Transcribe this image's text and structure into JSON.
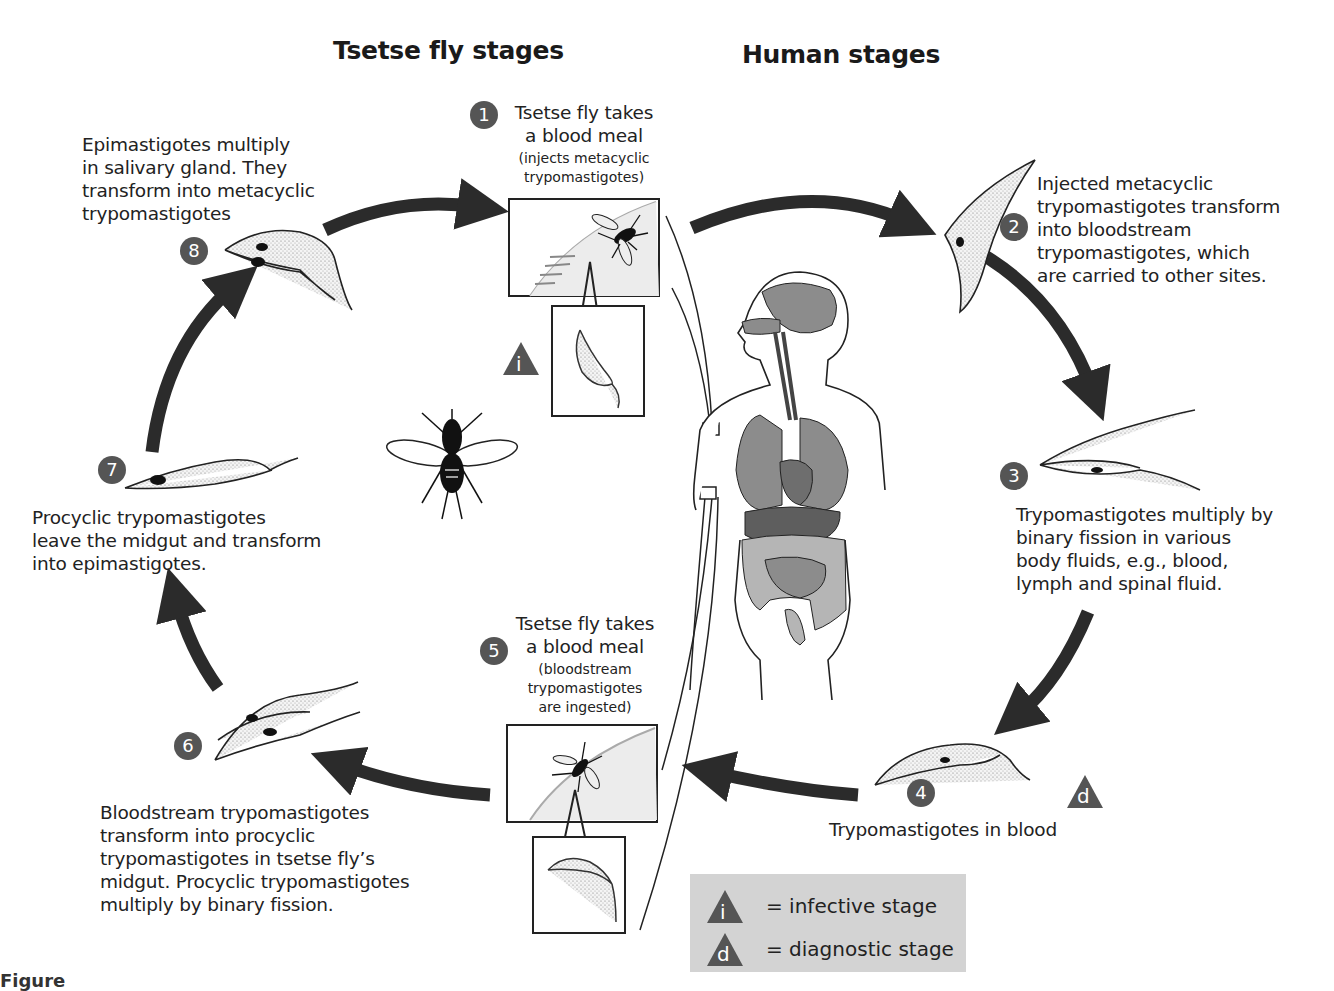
{
  "diagram": {
    "headings": {
      "tsetse": "Tsetse fly stages",
      "human": "Human stages"
    },
    "steps": [
      {
        "number": "1",
        "title": "Tsetse fly takes\na blood meal",
        "detail": "(injects metacyclic\ntrypomastigotes)"
      },
      {
        "number": "2",
        "text": "Injected metacyclic\ntrypomastigotes transform\ninto bloodstream\ntrypomastigotes, which\nare carried to other sites."
      },
      {
        "number": "3",
        "text": "Trypomastigotes multiply by\nbinary fission in various\nbody fluids, e.g., blood,\nlymph and spinal fluid."
      },
      {
        "number": "4",
        "text": "Trypomastigotes in blood"
      },
      {
        "number": "5",
        "title": "Tsetse fly takes\na blood meal",
        "detail": "(bloodstream\ntrypomastigotes\nare ingested)"
      },
      {
        "number": "6",
        "text": "Bloodstream trypomastigotes\ntransform into procyclic\ntrypomastigotes in tsetse fly’s\nmidgut. Procyclic trypomastigotes\nmultiply by binary fission."
      },
      {
        "number": "7",
        "text": "Procyclic trypomastigotes\nleave the midgut and transform\ninto epimastigotes."
      },
      {
        "number": "8",
        "text": "Epimastigotes multiply\nin salivary gland. They\ntransform into metacyclic\ntrypomastigotes"
      }
    ],
    "markers": {
      "infective_symbol": "i",
      "diagnostic_symbol": "d"
    },
    "legend": {
      "infective": {
        "symbol": "i",
        "label": "= infective stage"
      },
      "diagnostic": {
        "symbol": "d",
        "label": "= diagnostic stage"
      }
    },
    "caption": "Figure"
  },
  "colors": {
    "arrow": "#2b2b2b",
    "number_circle": "#555555",
    "triangle": "#555555",
    "legend_bg": "#d3d3d3",
    "organ_dark": "#6e6e6e",
    "organ_mid": "#8c8c8c",
    "organ_light": "#b5b5b5"
  }
}
